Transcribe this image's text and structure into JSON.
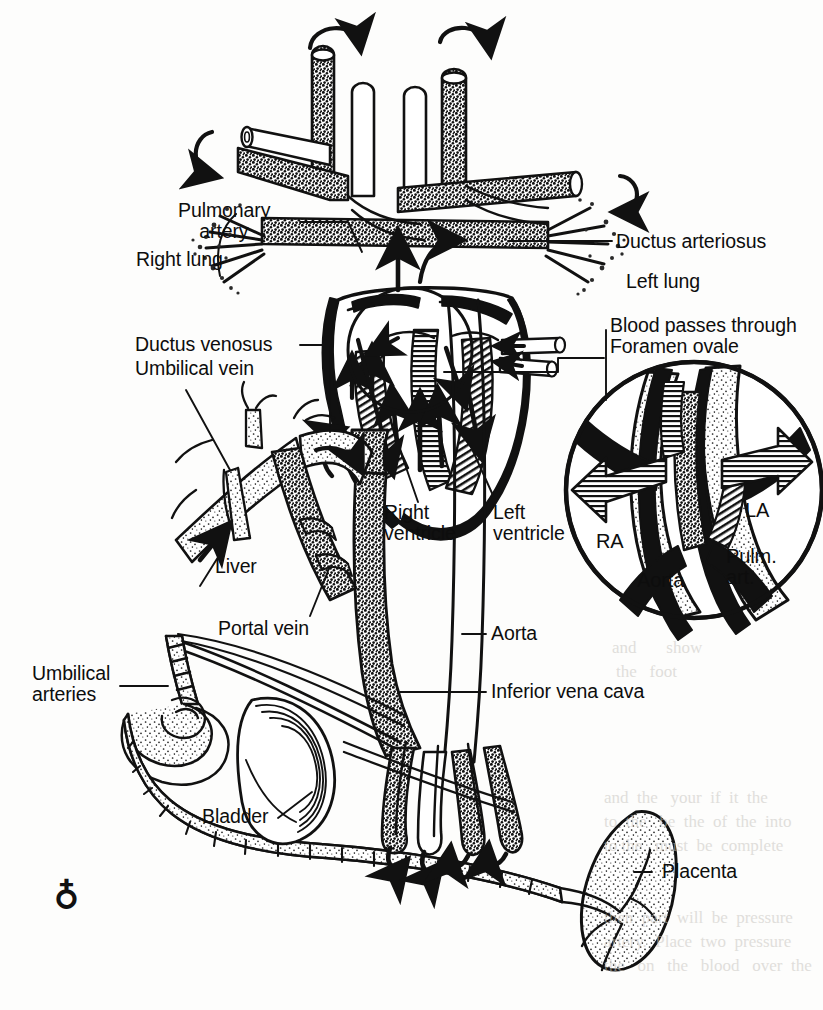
{
  "figure": {
    "background_color": "#fdfdfc",
    "ink_color": "#0d0d0d",
    "signature": "♁"
  },
  "labels": {
    "pulmonary_artery": "Pulmonary\n    artery",
    "right_lung": "Right lung",
    "ductus_arteriosus": "Ductus arteriosus",
    "left_lung": "Left lung",
    "ductus_venosus": "Ductus venosus",
    "umbilical_vein": "Umbilical vein",
    "foramen_ovale": "Blood passes through\nForamen ovale",
    "right_ventricle": "Right\nventricle",
    "left_ventricle": "Left\nventricle",
    "liver": "Liver",
    "portal_vein": "Portal vein",
    "aorta": "Aorta",
    "umbilical_arteries": "Umbilical\narteries",
    "inferior_vena_cava": "Inferior vena cava",
    "bladder": "Bladder",
    "placenta": "Placenta"
  },
  "inset": {
    "name": "foramen-ovale-detail",
    "ra": "RA",
    "la": "LA",
    "aorta": "Aorta",
    "pulmonary_artery": "Pulm.\nart."
  },
  "bleedthrough": {
    "line1": "and       show",
    "line2": "the   foot",
    "line3": "and  the   your  if  it  the",
    "line4": "to  the   be  the  of  the  into",
    "line5": "to the   must  be  complete",
    "line6": "then  part  will  be  pressure",
    "line7": "artery.  Place  two  pressure",
    "line8": "the   on   the   blood   over  the"
  }
}
